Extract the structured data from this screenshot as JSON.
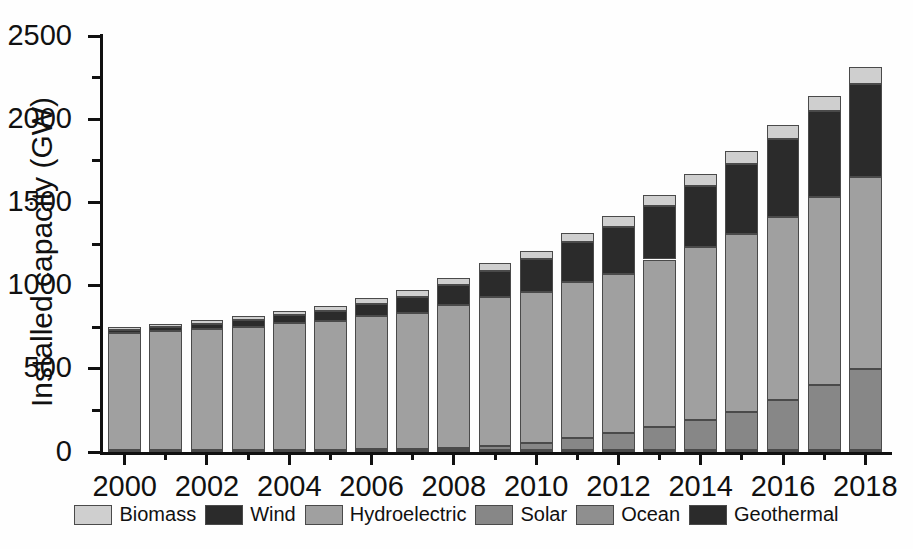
{
  "chart_data": {
    "type": "bar",
    "subtype": "stacked-bar",
    "title": "",
    "xlabel": "",
    "ylabel": "Installed capacity (GW)",
    "ylim": [
      0,
      2500
    ],
    "ytick_step": 500,
    "yminor_step": 250,
    "ytick_labels": [
      "0",
      "500",
      "1000",
      "1500",
      "2000",
      "2500"
    ],
    "ytick_values": [
      0,
      500,
      1000,
      1500,
      2000,
      2500
    ],
    "xlim": [
      1999.4,
      2018.6
    ],
    "xtick_labels": [
      "2000",
      "2002",
      "2004",
      "2006",
      "2008",
      "2010",
      "2012",
      "2014",
      "2016",
      "2018"
    ],
    "xtick_values": [
      2000,
      2002,
      2004,
      2006,
      2008,
      2010,
      2012,
      2014,
      2016,
      2018
    ],
    "grid": false,
    "legend_position": "bottom",
    "categories": [
      2000,
      2001,
      2002,
      2003,
      2004,
      2005,
      2006,
      2007,
      2008,
      2009,
      2010,
      2011,
      2012,
      2013,
      2014,
      2015,
      2016,
      2017,
      2018
    ],
    "stack_order_bottom_to_top": [
      "Geothermal",
      "Ocean",
      "Solar",
      "Hydroelectric",
      "Wind",
      "Biomass"
    ],
    "series": [
      {
        "name": "Geothermal",
        "color": "#2b2b2b",
        "values": [
          8,
          8,
          8,
          8,
          9,
          9,
          9,
          10,
          10,
          10,
          11,
          11,
          11,
          12,
          12,
          12,
          13,
          13,
          13
        ]
      },
      {
        "name": "Ocean",
        "color": "#8f8f8f",
        "values": [
          1,
          1,
          1,
          1,
          1,
          1,
          1,
          1,
          1,
          1,
          1,
          1,
          1,
          1,
          1,
          1,
          1,
          1,
          1
        ]
      },
      {
        "name": "Solar",
        "color": "#878787",
        "values": [
          1,
          1,
          2,
          2,
          3,
          5,
          6,
          9,
          15,
          23,
          40,
          70,
          104,
          139,
          177,
          228,
          298,
          390,
          486
        ]
      },
      {
        "name": "Hydroelectric",
        "color": "#a0a0a0",
        "values": [
          705,
          718,
          730,
          742,
          760,
          775,
          800,
          818,
          855,
          895,
          910,
          940,
          955,
          1005,
          1040,
          1070,
          1100,
          1130,
          1150
        ]
      },
      {
        "name": "Wind",
        "color": "#2b2b2b",
        "values": [
          17,
          24,
          31,
          40,
          48,
          59,
          74,
          94,
          121,
          159,
          198,
          238,
          283,
          319,
          370,
          420,
          467,
          514,
          564
        ]
      },
      {
        "name": "Biomass",
        "color": "#cfcfcf",
        "values": [
          18,
          20,
          22,
          25,
          28,
          31,
          35,
          39,
          42,
          45,
          50,
          55,
          62,
          68,
          73,
          79,
          85,
          91,
          97
        ]
      }
    ],
    "totals": [
      750,
      772,
      794,
      818,
      849,
      880,
      925,
      971,
      1044,
      1133,
      1210,
      1315,
      1416,
      1544,
      1673,
      1810,
      1964,
      2139,
      2311
    ],
    "colors": {
      "biomass": "#cfcfcf",
      "wind": "#2b2b2b",
      "hydroelectric": "#a0a0a0",
      "solar": "#878787",
      "ocean": "#8f8f8f",
      "geothermal": "#2b2b2b",
      "axis": "#111111",
      "background": "#ffffff",
      "segment_outline": "#4a4a4a"
    }
  },
  "legend": {
    "items": [
      {
        "label": "Biomass",
        "color": "#cfcfcf"
      },
      {
        "label": "Wind",
        "color": "#2b2b2b"
      },
      {
        "label": "Hydroelectric",
        "color": "#a0a0a0"
      },
      {
        "label": "Solar",
        "color": "#878787"
      },
      {
        "label": "Ocean",
        "color": "#8f8f8f"
      },
      {
        "label": "Geothermal",
        "color": "#2b2b2b"
      }
    ]
  }
}
